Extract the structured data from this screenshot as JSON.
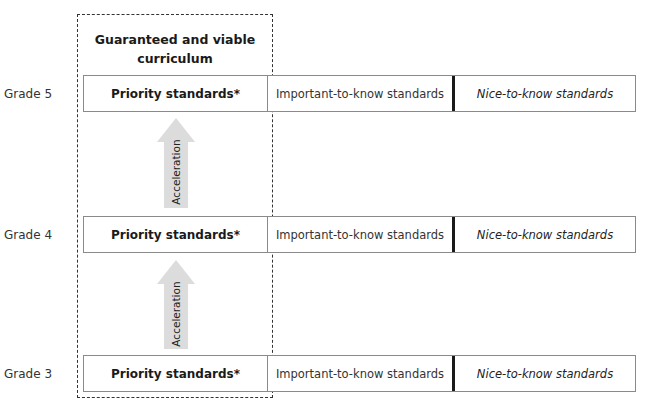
{
  "diagram": {
    "box_title": "Guaranteed and viable curriculum",
    "rows": [
      {
        "grade": "Grade 5",
        "priority": "Priority standards*",
        "important": "Important-to-know standards",
        "nice": "Nice-to-know standards"
      },
      {
        "grade": "Grade 4",
        "priority": "Priority standards*",
        "important": "Important-to-know standards",
        "nice": "Nice-to-know standards"
      },
      {
        "grade": "Grade 3",
        "priority": "Priority standards*",
        "important": "Important-to-know standards",
        "nice": "Nice-to-know standards"
      }
    ],
    "arrows": [
      {
        "label": "Acceleration"
      },
      {
        "label": "Acceleration"
      }
    ],
    "colors": {
      "arrow_fill": "#dcdcdc",
      "border": "#8a8a8a",
      "divider": "#1a1a1a"
    }
  }
}
